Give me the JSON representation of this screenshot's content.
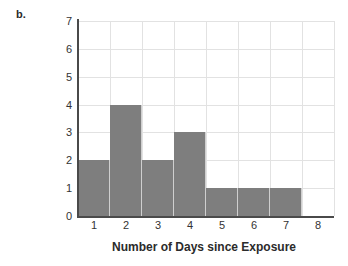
{
  "panel": {
    "label": "b."
  },
  "chart_data": {
    "type": "bar",
    "title": "",
    "subtitle": "",
    "xlabel": "Number of Days since Exposure",
    "ylabel": "Frequency",
    "categories": [
      "1",
      "2",
      "3",
      "4",
      "5",
      "6",
      "7"
    ],
    "values": [
      2,
      4,
      2,
      3,
      1,
      1,
      1
    ],
    "series": [
      {
        "name": "Frequency",
        "values": [
          2,
          4,
          2,
          3,
          1,
          1,
          1
        ]
      }
    ],
    "xlim": [
      0.5,
      8.5
    ],
    "ylim": [
      0,
      7
    ],
    "x_tick_labels": [
      "1",
      "2",
      "3",
      "4",
      "5",
      "6",
      "7",
      "8"
    ],
    "y_tick_labels": [
      "0",
      "1",
      "2",
      "3",
      "4",
      "5",
      "6",
      "7"
    ],
    "bar_width": 1,
    "bar_color": "#7e7e7e",
    "grid": true,
    "grid_color": "#e2e2e2",
    "axis_color": "#4a4a4a",
    "legend": false,
    "legend_position": "none",
    "annotations": []
  }
}
